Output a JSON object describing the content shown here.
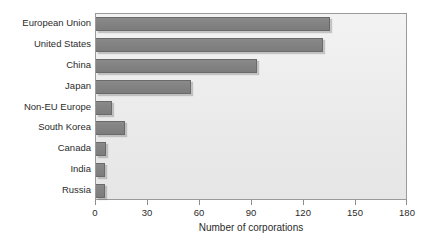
{
  "chart_data": {
    "type": "bar",
    "orientation": "horizontal",
    "title": "",
    "xlabel": "Number of corporations",
    "ylabel": "",
    "xlim": [
      0,
      180
    ],
    "xticks": [
      0,
      30,
      60,
      90,
      120,
      150,
      180
    ],
    "grid": false,
    "legend": null,
    "categories": [
      "European Union",
      "United States",
      "China",
      "Japan",
      "Non-EU Europe",
      "South Korea",
      "Canada",
      "India",
      "Russia"
    ],
    "values": [
      135,
      131,
      93,
      55,
      9,
      17,
      6,
      5,
      5
    ],
    "series": [
      {
        "name": "Number of corporations",
        "values": [
          135,
          131,
          93,
          55,
          9,
          17,
          6,
          5,
          5
        ]
      }
    ],
    "colors": {
      "bar_fill": "#848484",
      "bar_border": "#6a6a6a",
      "plot_background": "#eaeaea",
      "frame": "#9a9a9a",
      "text": "#2b2b2b",
      "page_background": "#ffffff"
    }
  }
}
